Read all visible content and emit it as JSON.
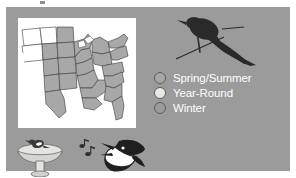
{
  "slide": {
    "background_color": "#9b9b9b",
    "page_background": "#ffffff"
  },
  "map": {
    "name": "us-range-map",
    "panel_background": "#ffffff",
    "shaded_color": "#a8a8a8",
    "outline_color": "#3a3a3a",
    "description": "Map of the United States with central and eastern states shaded"
  },
  "bird_image": {
    "name": "grackle-silhouette",
    "color": "#2a2a2a",
    "description": "Dark perched bird silhouette with long tail on a branch"
  },
  "legend": {
    "items": [
      {
        "label": "Spring/Summer",
        "fill": "#a8a8a8",
        "stroke": "#5d5d5d"
      },
      {
        "label": "Year-Round",
        "fill": "#e8e8e3",
        "stroke": "#5d5d5d"
      },
      {
        "label": "Winter",
        "fill": "#9b9b9b",
        "stroke": "#5d5d5d"
      }
    ],
    "text_color": "#ffffff"
  },
  "icons": {
    "birdbath": "birdbath-icon",
    "music_notes": "music-notes-icon",
    "singing_bird": "singing-bird-head-icon"
  }
}
